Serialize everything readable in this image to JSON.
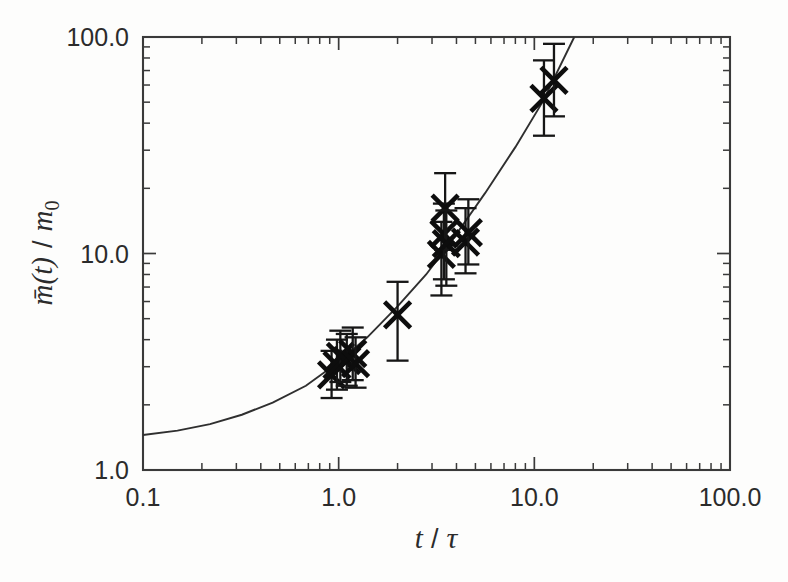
{
  "chart_data": {
    "type": "scatter",
    "title": "",
    "subtitle": "",
    "xlabel": "t / τ",
    "ylabel": "m̄(t) / m₀",
    "xscale": "log",
    "yscale": "log",
    "xlim": [
      0.1,
      100.0
    ],
    "ylim": [
      1.0,
      100.0
    ],
    "grid": false,
    "legend": null,
    "x_tick_labels": [
      "0.1",
      "1.0",
      "10.0",
      "100.0"
    ],
    "x_tick_values": [
      0.1,
      1.0,
      10.0,
      100.0
    ],
    "y_tick_labels": [
      "1.0",
      "10.0",
      "100.0"
    ],
    "y_tick_values": [
      1.0,
      10.0,
      100.0
    ],
    "marker": "x",
    "errorbars": "vertical",
    "series": [
      {
        "name": "measurements",
        "marker": "x",
        "points": [
          {
            "x": 0.92,
            "y": 2.75,
            "yerr_low": 2.15,
            "yerr_high": 3.55
          },
          {
            "x": 0.98,
            "y": 3.05,
            "yerr_low": 2.35,
            "yerr_high": 4.0
          },
          {
            "x": 1.02,
            "y": 3.35,
            "yerr_low": 2.55,
            "yerr_high": 4.4
          },
          {
            "x": 1.1,
            "y": 3.2,
            "yerr_low": 2.45,
            "yerr_high": 4.25
          },
          {
            "x": 1.18,
            "y": 3.45,
            "yerr_low": 2.6,
            "yerr_high": 4.55
          },
          {
            "x": 1.22,
            "y": 3.1,
            "yerr_low": 2.4,
            "yerr_high": 4.1
          },
          {
            "x": 2.0,
            "y": 5.2,
            "yerr_low": 3.2,
            "yerr_high": 7.4
          },
          {
            "x": 3.35,
            "y": 9.9,
            "yerr_low": 6.4,
            "yerr_high": 14.0
          },
          {
            "x": 3.45,
            "y": 12.3,
            "yerr_low": 7.6,
            "yerr_high": 17.0
          },
          {
            "x": 3.5,
            "y": 16.2,
            "yerr_low": 10.4,
            "yerr_high": 23.5
          },
          {
            "x": 3.55,
            "y": 11.1,
            "yerr_low": 7.1,
            "yerr_high": 15.8
          },
          {
            "x": 4.45,
            "y": 11.3,
            "yerr_low": 8.1,
            "yerr_high": 16.2
          },
          {
            "x": 4.6,
            "y": 12.5,
            "yerr_low": 8.9,
            "yerr_high": 17.8
          },
          {
            "x": 11.2,
            "y": 52.0,
            "yerr_low": 35.0,
            "yerr_high": 78.0
          },
          {
            "x": 12.6,
            "y": 63.0,
            "yerr_low": 43.0,
            "yerr_high": 93.0
          }
        ]
      },
      {
        "name": "model-curve",
        "type": "line",
        "x": [
          0.1,
          0.15,
          0.22,
          0.32,
          0.46,
          0.68,
          1.0,
          1.4,
          2.0,
          2.8,
          4.0,
          5.6,
          8.0,
          11.0,
          16.0
        ],
        "y": [
          1.45,
          1.52,
          1.63,
          1.8,
          2.05,
          2.45,
          3.15,
          4.1,
          5.7,
          8.0,
          12.3,
          19.0,
          31.0,
          50.0,
          100.0
        ]
      }
    ]
  }
}
